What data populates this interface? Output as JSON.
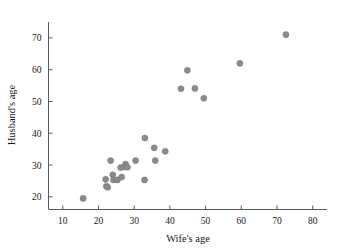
{
  "chart_data": {
    "type": "scatter",
    "title": "",
    "xlabel": "Wife's age",
    "ylabel": "Husband's age",
    "xlim": [
      6,
      84
    ],
    "ylim": [
      16,
      75
    ],
    "xticks": [
      10,
      20,
      30,
      40,
      50,
      60,
      70,
      80
    ],
    "yticks": [
      20,
      30,
      40,
      50,
      60,
      70
    ],
    "grid": false,
    "legend": null,
    "marker": {
      "shape": "circle",
      "color": "#8a8a8a",
      "size": 3.1
    },
    "points": [
      {
        "x": 15.7,
        "y": 19.5
      },
      {
        "x": 22.0,
        "y": 25.5
      },
      {
        "x": 22.2,
        "y": 23.3
      },
      {
        "x": 22.6,
        "y": 23.0
      },
      {
        "x": 23.4,
        "y": 31.4
      },
      {
        "x": 24.0,
        "y": 26.9
      },
      {
        "x": 24.2,
        "y": 25.3
      },
      {
        "x": 25.3,
        "y": 25.3
      },
      {
        "x": 26.2,
        "y": 29.2
      },
      {
        "x": 26.5,
        "y": 26.2
      },
      {
        "x": 27.2,
        "y": 29.4
      },
      {
        "x": 27.6,
        "y": 30.3
      },
      {
        "x": 28.1,
        "y": 29.3
      },
      {
        "x": 30.4,
        "y": 31.4
      },
      {
        "x": 32.9,
        "y": 25.3
      },
      {
        "x": 33.0,
        "y": 38.5
      },
      {
        "x": 35.6,
        "y": 35.4
      },
      {
        "x": 35.9,
        "y": 31.4
      },
      {
        "x": 38.7,
        "y": 34.3
      },
      {
        "x": 43.1,
        "y": 54.0
      },
      {
        "x": 44.9,
        "y": 59.8
      },
      {
        "x": 47.0,
        "y": 54.1
      },
      {
        "x": 49.5,
        "y": 51.0
      },
      {
        "x": 59.6,
        "y": 62.0
      },
      {
        "x": 72.5,
        "y": 71.0
      }
    ],
    "n_points": 25
  },
  "tick_labels": {
    "x": [
      "10",
      "20",
      "30",
      "40",
      "50",
      "60",
      "70",
      "80"
    ],
    "y": [
      "20",
      "30",
      "40",
      "50",
      "60",
      "70"
    ]
  },
  "axis_titles": {
    "x": "Wife's age",
    "y": "Husband's age"
  }
}
